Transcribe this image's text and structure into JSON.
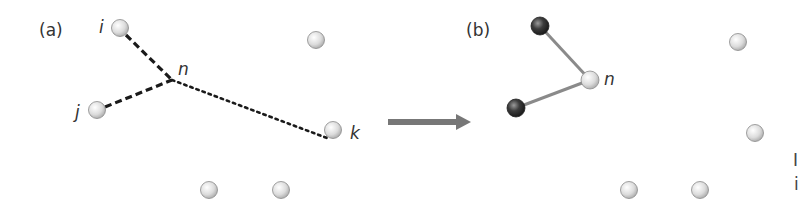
{
  "panels": {
    "a": {
      "label": "(a)",
      "nodes": [
        {
          "id": "i",
          "label": "i",
          "x": 120,
          "y": 28,
          "type": "light"
        },
        {
          "id": "j",
          "label": "j",
          "x": 97,
          "y": 110,
          "type": "light"
        },
        {
          "id": "k",
          "label": "k",
          "x": 333,
          "y": 130,
          "type": "light"
        },
        {
          "id": "a4",
          "label": "",
          "x": 316,
          "y": 40,
          "type": "light"
        },
        {
          "id": "a5",
          "label": "",
          "x": 209,
          "y": 190,
          "type": "light"
        },
        {
          "id": "a6",
          "label": "",
          "x": 281,
          "y": 190,
          "type": "light"
        }
      ],
      "junction": {
        "label": "n",
        "x": 172,
        "y": 80
      },
      "edges": [
        {
          "from": "i",
          "to": "n",
          "style": "dashed"
        },
        {
          "from": "j",
          "to": "n",
          "style": "dashed"
        },
        {
          "from": "n",
          "to": "k",
          "style": "dotted"
        }
      ]
    },
    "b": {
      "label": "(b)",
      "nodes": [
        {
          "id": "n",
          "label": "n",
          "x": 590,
          "y": 80,
          "type": "light"
        },
        {
          "id": "b_top",
          "label": "",
          "x": 540,
          "y": 26,
          "type": "dark"
        },
        {
          "id": "b_bottom",
          "label": "",
          "x": 516,
          "y": 108,
          "type": "dark"
        },
        {
          "id": "b4",
          "label": "",
          "x": 738,
          "y": 42,
          "type": "light"
        },
        {
          "id": "b5",
          "label": "",
          "x": 755,
          "y": 133,
          "type": "light"
        },
        {
          "id": "b6",
          "label": "",
          "x": 629,
          "y": 190,
          "type": "light"
        },
        {
          "id": "b7",
          "label": "",
          "x": 700,
          "y": 190,
          "type": "light"
        }
      ],
      "edges": [
        {
          "from": "b_top",
          "to": "n",
          "style": "solid"
        },
        {
          "from": "b_bottom",
          "to": "n",
          "style": "solid"
        }
      ]
    }
  },
  "arrow": {
    "x1": 388,
    "x2": 470,
    "y": 122,
    "color": "#777777"
  },
  "colors": {
    "dashed_edge": "#1a1a1a",
    "solid_edge": "#8a8a8a",
    "light_node": "#e6e6e6",
    "dark_node": "#3a3a3a"
  },
  "cut_text": [
    "I",
    "i"
  ]
}
